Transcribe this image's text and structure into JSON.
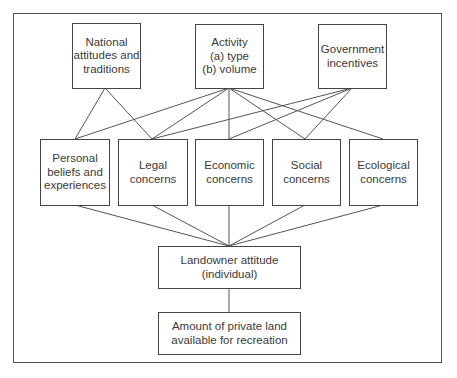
{
  "diagram": {
    "type": "flow-hierarchy",
    "nodes": {
      "national": {
        "label": "National\nattitudes and\ntraditions"
      },
      "activity": {
        "label": "Activity\n(a) type\n(b) volume"
      },
      "government": {
        "label": "Government\nincentives"
      },
      "personal": {
        "label": "Personal\nbeliefs and\nexperiences"
      },
      "legal": {
        "label": "Legal\nconcerns"
      },
      "economic": {
        "label": "Economic\nconcerns"
      },
      "social": {
        "label": "Social\nconcerns"
      },
      "ecological": {
        "label": "Ecological\nconcerns"
      },
      "landowner": {
        "label": "Landowner attitude\n(individual)"
      },
      "amount": {
        "label": "Amount of private land\navailable for recreation"
      }
    },
    "edges": [
      [
        "national",
        "personal"
      ],
      [
        "national",
        "legal"
      ],
      [
        "activity",
        "personal"
      ],
      [
        "activity",
        "legal"
      ],
      [
        "activity",
        "economic"
      ],
      [
        "activity",
        "social"
      ],
      [
        "activity",
        "ecological"
      ],
      [
        "government",
        "legal"
      ],
      [
        "government",
        "economic"
      ],
      [
        "government",
        "social"
      ],
      [
        "personal",
        "landowner"
      ],
      [
        "legal",
        "landowner"
      ],
      [
        "economic",
        "landowner"
      ],
      [
        "social",
        "landowner"
      ],
      [
        "ecological",
        "landowner"
      ],
      [
        "landowner",
        "amount"
      ]
    ]
  }
}
